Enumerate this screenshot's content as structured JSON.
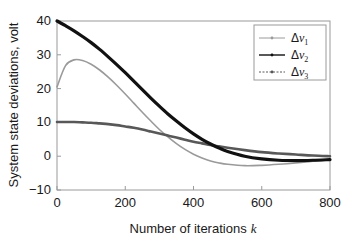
{
  "chart_data": {
    "type": "line",
    "title": "",
    "xlabel": "Number of iterations k",
    "ylabel": "System state deviations, volt",
    "xlim": [
      0,
      800
    ],
    "ylim": [
      -10,
      40
    ],
    "xticks": [
      "0",
      "200",
      "400",
      "600",
      "800"
    ],
    "xtick_values": [
      0,
      200,
      400,
      600,
      800
    ],
    "yticks": [
      "-10",
      "0",
      "10",
      "20",
      "30",
      "40"
    ],
    "ytick_values": [
      -10,
      0,
      10,
      20,
      30,
      40
    ],
    "grid": false,
    "legend_position": "upper-right",
    "x": [
      0,
      25,
      50,
      75,
      100,
      125,
      150,
      175,
      200,
      225,
      250,
      275,
      300,
      325,
      350,
      375,
      400,
      425,
      450,
      475,
      500,
      550,
      600,
      650,
      700,
      750,
      800
    ],
    "series": [
      {
        "name": "Δv1",
        "label_base": "Δv",
        "label_sub": "1",
        "color": "#9a9a9a",
        "linewidth": 1.6,
        "values": [
          20.5,
          26.8,
          28.5,
          28.3,
          27.2,
          25.5,
          23.4,
          21.0,
          18.4,
          15.7,
          13.0,
          10.4,
          7.9,
          5.7,
          3.7,
          2.0,
          0.6,
          -0.5,
          -1.4,
          -2.0,
          -2.4,
          -2.8,
          -2.7,
          -2.4,
          -2.0,
          -1.5,
          -1.0
        ]
      },
      {
        "name": "Δv2",
        "label_base": "Δv",
        "label_sub": "2",
        "color": "#111111",
        "linewidth": 3.2,
        "values": [
          40.0,
          38.6,
          37.1,
          35.4,
          33.6,
          31.6,
          29.4,
          27.1,
          24.7,
          22.2,
          19.7,
          17.2,
          14.8,
          12.5,
          10.4,
          8.4,
          6.6,
          5.0,
          3.6,
          2.4,
          1.4,
          0.0,
          -0.8,
          -1.2,
          -1.3,
          -1.2,
          -1.0
        ]
      },
      {
        "name": "Δv3",
        "label_base": "Δv",
        "label_sub": "3",
        "color": "#585858",
        "linewidth": 2.6,
        "values": [
          10.1,
          10.1,
          10.1,
          10.0,
          9.9,
          9.7,
          9.5,
          9.2,
          8.8,
          8.4,
          7.9,
          7.3,
          6.7,
          6.1,
          5.5,
          4.9,
          4.3,
          3.8,
          3.3,
          2.9,
          2.5,
          1.8,
          1.2,
          0.8,
          0.5,
          0.2,
          0.0
        ]
      }
    ]
  },
  "axis": {
    "frame_color": "#9a9a9a",
    "text_color": "#1a1a1a"
  }
}
